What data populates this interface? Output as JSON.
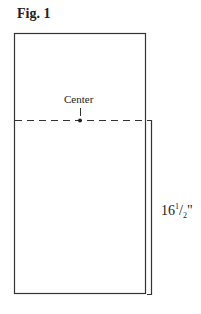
{
  "figure": {
    "title": "Fig. 1",
    "center_label": "Center",
    "dimension": {
      "whole": "16",
      "numerator": "1",
      "denominator": "2",
      "unit": "\""
    }
  },
  "colors": {
    "line": "#333333"
  }
}
